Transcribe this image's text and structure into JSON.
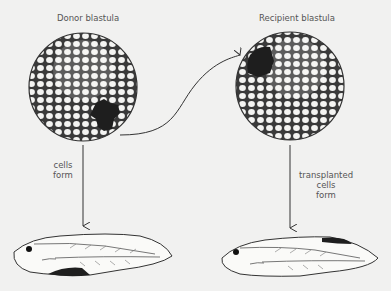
{
  "labels": {
    "donor": "Donor blastula",
    "recipient": "Recipient blastula",
    "left_arrow_line1": "cells",
    "left_arrow_line2": "form",
    "right_arrow_line1": "transplanted",
    "right_arrow_line2": "cells",
    "right_arrow_line3": "form"
  },
  "colors": {
    "background": "#f1f1f0",
    "line": "#333333",
    "dark_tissue": "#1e1e1e"
  }
}
